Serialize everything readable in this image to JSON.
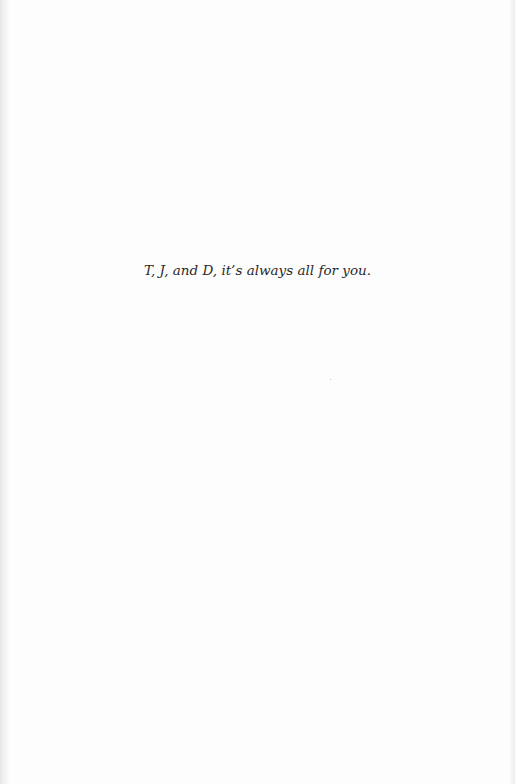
{
  "page": {
    "type": "dedication-page",
    "dedication_text": "T, J, and D, it’s always all for you."
  }
}
